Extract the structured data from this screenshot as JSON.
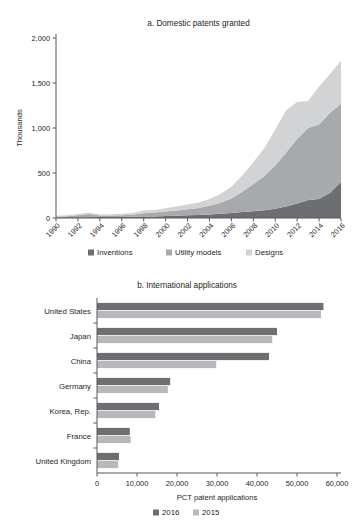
{
  "chart_data": [
    {
      "id": "a",
      "type": "area",
      "title": "a. Domestic patents granted",
      "xlabel": "",
      "ylabel": "Thousands",
      "ylim": [
        0,
        2000
      ],
      "yticks": [
        0,
        500,
        1000,
        1500,
        2000
      ],
      "ytick_labels": [
        "0",
        "500",
        "1,000",
        "1,500",
        "2,000"
      ],
      "xlim": [
        1990,
        2016
      ],
      "xticks": [
        1990,
        1992,
        1994,
        1996,
        1998,
        2000,
        2002,
        2004,
        2006,
        2008,
        2010,
        2012,
        2014,
        2016
      ],
      "xtick_labels": [
        "1990",
        "1992",
        "1994",
        "1996",
        "1998",
        "2000",
        "2002",
        "2004",
        "2006",
        "2008",
        "2010",
        "2012",
        "2014",
        "2016"
      ],
      "grid": false,
      "legend_position": "bottom",
      "x": [
        1990,
        1991,
        1992,
        1993,
        1994,
        1995,
        1996,
        1997,
        1998,
        1999,
        2000,
        2001,
        2002,
        2003,
        2004,
        2005,
        2006,
        2007,
        2008,
        2009,
        2010,
        2011,
        2012,
        2013,
        2014,
        2015,
        2016
      ],
      "series": [
        {
          "name": "Inventions",
          "color": "#6d6e71",
          "values": [
            6,
            7,
            8,
            9,
            10,
            11,
            12,
            14,
            16,
            18,
            22,
            26,
            30,
            34,
            40,
            48,
            56,
            66,
            76,
            86,
            104,
            128,
            160,
            200,
            210,
            280,
            400
          ]
        },
        {
          "name": "Utility models",
          "color": "#a7a9ac",
          "values": [
            10,
            12,
            22,
            36,
            18,
            16,
            18,
            22,
            36,
            42,
            50,
            58,
            66,
            76,
            96,
            122,
            160,
            226,
            300,
            380,
            480,
            600,
            720,
            800,
            830,
            890,
            870
          ]
        },
        {
          "name": "Designs",
          "color": "#d1d3d4",
          "values": [
            10,
            12,
            14,
            14,
            14,
            14,
            16,
            20,
            30,
            30,
            36,
            44,
            54,
            62,
            76,
            98,
            130,
            180,
            244,
            310,
            400,
            470,
            410,
            300,
            420,
            430,
            480
          ]
        }
      ]
    },
    {
      "id": "b",
      "type": "bar",
      "orientation": "horizontal",
      "title": "b. International applications",
      "xlabel": "PCT patent applications",
      "ylabel": "",
      "xlim": [
        0,
        60000
      ],
      "xticks": [
        0,
        10000,
        20000,
        30000,
        40000,
        50000,
        60000
      ],
      "xtick_labels": [
        "0",
        "10,000",
        "20,000",
        "30,000",
        "40,000",
        "50,000",
        "60,000"
      ],
      "grid": false,
      "legend_position": "bottom",
      "categories": [
        "United States",
        "Japan",
        "China",
        "Germany",
        "Korea, Rep.",
        "France",
        "United Kingdom"
      ],
      "series": [
        {
          "name": "2016",
          "color": "#6d6e71",
          "values": [
            56600,
            45000,
            43000,
            18300,
            15500,
            8200,
            5500
          ]
        },
        {
          "name": "2015",
          "color": "#b6b8ba",
          "values": [
            56000,
            43800,
            29800,
            17700,
            14600,
            8400,
            5300
          ]
        }
      ]
    }
  ]
}
